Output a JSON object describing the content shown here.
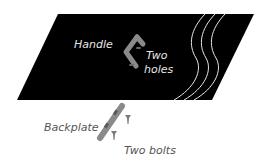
{
  "diagram": {
    "type": "exploded-assembly",
    "colors": {
      "panel": "#000000",
      "background": "#ffffff",
      "wave_lines": "#e8e8e8",
      "part": "#8a8a8a",
      "part_dark": "#5a5a5a",
      "label_on_panel": "#e6e6e6",
      "label_on_white": "#555555"
    },
    "labels": {
      "handle": "Handle",
      "holes_line1": "Two",
      "holes_line2": "holes",
      "backplate": "Backplate",
      "bolts": "Two bolts"
    },
    "parts": [
      "panel",
      "handle",
      "two-holes",
      "backplate",
      "two-bolts"
    ]
  }
}
